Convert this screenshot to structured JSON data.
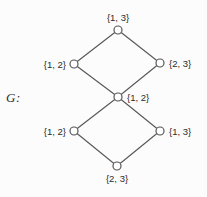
{
  "figure": {
    "label": "G:",
    "background": "#fcfcfc",
    "edge_color": "#565656",
    "node_stroke_color": "#565656",
    "node_fill_color": "#ffffff",
    "text_color": "#2b2b2b"
  },
  "graph": {
    "node_radius": 4,
    "nodes": [
      {
        "id": "top",
        "label": "{1, 3}",
        "x": 118,
        "y": 30,
        "label_pos": "above"
      },
      {
        "id": "upper-left",
        "label": "{1, 2}",
        "x": 74,
        "y": 64,
        "label_pos": "left"
      },
      {
        "id": "upper-right",
        "label": "{2, 3}",
        "x": 160,
        "y": 63,
        "label_pos": "right"
      },
      {
        "id": "middle",
        "label": "{1, 2}",
        "x": 118,
        "y": 97,
        "label_pos": "right"
      },
      {
        "id": "lower-left",
        "label": "{1, 2}",
        "x": 74,
        "y": 131,
        "label_pos": "left"
      },
      {
        "id": "lower-right",
        "label": "{1, 3}",
        "x": 160,
        "y": 131,
        "label_pos": "right"
      },
      {
        "id": "bottom",
        "label": "{2, 3}",
        "x": 117,
        "y": 166,
        "label_pos": "below"
      }
    ],
    "edges": [
      [
        "top",
        "upper-left"
      ],
      [
        "top",
        "upper-right"
      ],
      [
        "upper-left",
        "middle"
      ],
      [
        "upper-right",
        "middle"
      ],
      [
        "middle",
        "lower-left"
      ],
      [
        "middle",
        "lower-right"
      ],
      [
        "lower-left",
        "bottom"
      ],
      [
        "lower-right",
        "bottom"
      ]
    ]
  }
}
